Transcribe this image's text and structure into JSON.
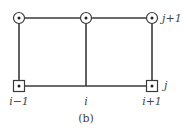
{
  "diagram": {
    "caption": "(b)",
    "colors": {
      "line": "#3a3a3a",
      "node_fill": "#ffffff",
      "text": "#444444"
    },
    "nodes": [
      {
        "id": "top-left",
        "shape": "circle",
        "x": 19,
        "y": 18
      },
      {
        "id": "top-middle",
        "shape": "circle",
        "x": 86,
        "y": 18
      },
      {
        "id": "top-right",
        "shape": "circle",
        "x": 152,
        "y": 18
      },
      {
        "id": "bottom-left",
        "shape": "square",
        "x": 19,
        "y": 86
      },
      {
        "id": "bottom-right",
        "shape": "square",
        "x": 152,
        "y": 86
      }
    ],
    "labels": {
      "col_left": "i−1",
      "col_mid": "i",
      "col_right": "i+1",
      "row_top": "j+1",
      "row_bottom": "j"
    }
  }
}
